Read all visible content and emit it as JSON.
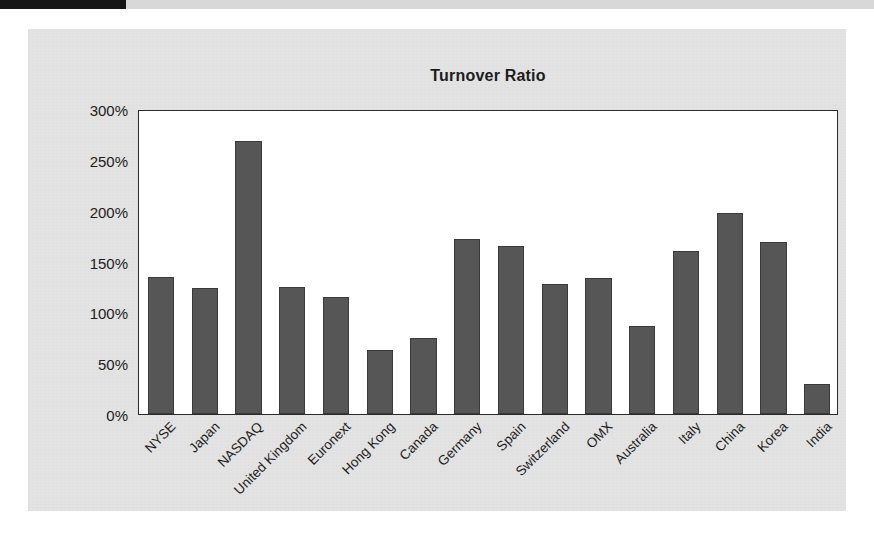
{
  "page": {
    "scan_band": ""
  },
  "chart_data": {
    "type": "bar",
    "title": "Turnover Ratio",
    "xlabel": "",
    "ylabel": "",
    "ylim": [
      0,
      300
    ],
    "grid": false,
    "legend": null,
    "y_ticks": [
      "0%",
      "50%",
      "100%",
      "150%",
      "200%",
      "250%",
      "300%"
    ],
    "y_tick_values": [
      0,
      50,
      100,
      150,
      200,
      250,
      300
    ],
    "unit": "%",
    "bar_color": "#565656",
    "categories": [
      "NYSE",
      "Japan",
      "NASDAQ",
      "United Kingdom",
      "Euronext",
      "Hong Kong",
      "Canada",
      "Germany",
      "Spain",
      "Switzerland",
      "OMX",
      "Australia",
      "Italy",
      "China",
      "Korea",
      "India"
    ],
    "values": [
      135,
      124,
      269,
      125,
      115,
      63,
      75,
      172,
      165,
      128,
      134,
      87,
      160,
      198,
      169,
      30
    ]
  }
}
